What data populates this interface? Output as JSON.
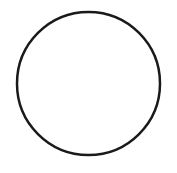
{
  "canvas": {
    "width": 177,
    "height": 173,
    "background_color": "#FFFFFF",
    "description": "Hand-drawn circle outline on plain white background"
  },
  "shapes": [
    {
      "name": "circle-outline",
      "type": "circle",
      "center_x": 88.5,
      "center_y": 83.5,
      "radius": 71.5,
      "diameter": 143,
      "stroke_color": "#1A1A1A",
      "stroke_width": 2.5,
      "fill": "none",
      "fill_color": "#FFFFFF"
    }
  ],
  "labels": {
    "figure_caption": "",
    "annotations": []
  }
}
